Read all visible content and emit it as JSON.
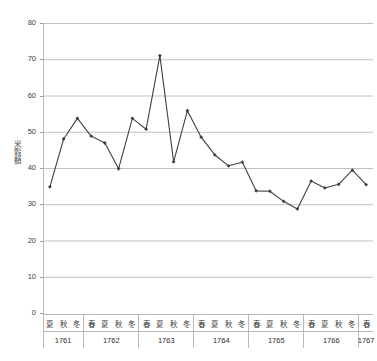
{
  "chart_data": {
    "type": "line",
    "title": "",
    "subtitle": "",
    "xlabel": "",
    "ylabel": "米穀額",
    "ylim": [
      0,
      80
    ],
    "ytick_labels": [
      "80",
      "70",
      "60",
      "50",
      "40",
      "30",
      "20",
      "10",
      "0"
    ],
    "ytick_values": [
      80,
      70,
      60,
      50,
      40,
      30,
      20,
      10,
      0
    ],
    "grid": true,
    "legend": "none",
    "line_color": "#404040",
    "marker": "diamond",
    "categories": [
      "夏 1761",
      "秋 1761",
      "冬 1761",
      "春 1762",
      "夏 1762",
      "秋 1762",
      "冬 1762",
      "春 1763",
      "夏 1763",
      "秋 1763",
      "冬 1763",
      "春 1764",
      "夏 1764",
      "秋 1764",
      "冬 1764",
      "春 1765",
      "夏 1765",
      "秋 1765",
      "冬 1765",
      "春 1766",
      "夏 1766",
      "秋 1766",
      "冬 1766",
      "春 1767"
    ],
    "values": [
      34.8,
      48.0,
      53.7,
      48.8,
      46.9,
      39.8,
      53.7,
      50.7,
      71.0,
      41.7,
      55.8,
      48.5,
      43.6,
      40.6,
      41.6,
      33.7,
      33.6,
      30.8,
      28.7,
      36.4,
      34.5,
      35.5,
      39.4,
      35.4
    ],
    "year_groups": [
      {
        "year": "1761",
        "seasons": [
          "夏",
          "秋",
          "冬"
        ]
      },
      {
        "year": "1762",
        "seasons": [
          "春",
          "夏",
          "秋",
          "冬"
        ]
      },
      {
        "year": "1763",
        "seasons": [
          "春",
          "夏",
          "秋",
          "冬"
        ]
      },
      {
        "year": "1764",
        "seasons": [
          "春",
          "夏",
          "秋",
          "冬"
        ]
      },
      {
        "year": "1765",
        "seasons": [
          "春",
          "夏",
          "秋",
          "冬"
        ]
      },
      {
        "year": "1766",
        "seasons": [
          "春",
          "夏",
          "秋",
          "冬"
        ]
      },
      {
        "year": "1767",
        "seasons": [
          "春"
        ]
      }
    ]
  }
}
